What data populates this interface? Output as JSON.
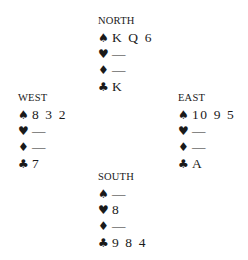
{
  "hands": {
    "north": {
      "title": "NORTH",
      "suits": [
        {
          "symbol": "♠",
          "cards": "K Q 6"
        },
        {
          "symbol": "♥",
          "cards": "—"
        },
        {
          "symbol": "♦",
          "cards": "—"
        },
        {
          "symbol": "♣",
          "cards": "K"
        }
      ]
    },
    "west": {
      "title": "WEST",
      "suits": [
        {
          "symbol": "♠",
          "cards": "8 3 2"
        },
        {
          "symbol": "♥",
          "cards": "—"
        },
        {
          "symbol": "♦",
          "cards": "—"
        },
        {
          "symbol": "♣",
          "cards": "7"
        }
      ]
    },
    "east": {
      "title": "EAST",
      "suits": [
        {
          "symbol": "♠",
          "cards": "10 9 5"
        },
        {
          "symbol": "♥",
          "cards": "—"
        },
        {
          "symbol": "♦",
          "cards": "—"
        },
        {
          "symbol": "♣",
          "cards": "A"
        }
      ]
    },
    "south": {
      "title": "SOUTH",
      "suits": [
        {
          "symbol": "♠",
          "cards": "—"
        },
        {
          "symbol": "♥",
          "cards": "8"
        },
        {
          "symbol": "♦",
          "cards": "—"
        },
        {
          "symbol": "♣",
          "cards": "9 8 4"
        }
      ]
    }
  }
}
